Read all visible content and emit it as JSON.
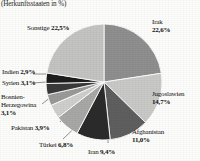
{
  "subtitle": "(Herkunftsstaaten in %)",
  "chart_data": {
    "type": "pie",
    "title": "",
    "subtitle": "(Herkunftsstaaten in %)",
    "xlabel": "",
    "ylabel": "",
    "units": "%",
    "decimal_separator": ",",
    "legend_position": "labels-around-pie",
    "grid": false,
    "start_angle_deg": 0,
    "direction": "clockwise",
    "categories": [
      "Irak",
      "Jugoslawien",
      "Afghanistan",
      "Iran",
      "Türkei",
      "Pakistan",
      "Bosnien-Herzegowina",
      "Syrien",
      "Indien",
      "Sonstige"
    ],
    "values": [
      22.6,
      14.7,
      11.0,
      9.4,
      6.8,
      3.9,
      3.1,
      3.1,
      2.9,
      22.5
    ],
    "value_labels": [
      "22,6%",
      "14,7%",
      "11,0%",
      "9,4%",
      "6,8%",
      "3,9%",
      "3,1%",
      "3,1%",
      "2,9%",
      "22,5%"
    ],
    "colors": [
      "#8f8f8f",
      "#c9c9c7",
      "#5f5f5f",
      "#2b2b2b",
      "#a8a8a6",
      "#cfcfcd",
      "#9a9a98",
      "#3a3a3a",
      "#1d1d1d",
      "#c4c4c2"
    ]
  },
  "slices": [
    {
      "name": "Irak",
      "label": "Irak",
      "value_label": "22,6%",
      "value": 22.6,
      "color": "#8f8f8f"
    },
    {
      "name": "Jugoslawien",
      "label": "Jugoslawien",
      "value_label": "14,7%",
      "value": 14.7,
      "color": "#c9c9c7"
    },
    {
      "name": "Afghanistan",
      "label": "Afghanistan",
      "value_label": "11,0%",
      "value": 11.0,
      "color": "#5f5f5f"
    },
    {
      "name": "Iran",
      "label": "Iran",
      "value_label": "9,4%",
      "value": 9.4,
      "color": "#2b2b2b"
    },
    {
      "name": "Tuerkei",
      "label": "Türkei",
      "value_label": "6,8%",
      "value": 6.8,
      "color": "#a8a8a6"
    },
    {
      "name": "Pakistan",
      "label": "Pakistan",
      "value_label": "3,9%",
      "value": 3.9,
      "color": "#cfcfcd"
    },
    {
      "name": "BosnienHerzegowina",
      "label": "Bosnien-Herzegowina",
      "label_line1": "Bosnien-",
      "label_line2": "Herzegowina",
      "value_label": "3,1%",
      "value": 3.1,
      "color": "#9a9a98"
    },
    {
      "name": "Syrien",
      "label": "Syrien",
      "value_label": "3,1%",
      "value": 3.1,
      "color": "#3a3a3a"
    },
    {
      "name": "Indien",
      "label": "Indien",
      "value_label": "2,9%",
      "value": 2.9,
      "color": "#1d1d1d"
    },
    {
      "name": "Sonstige",
      "label": "Sonstige",
      "value_label": "22,5%",
      "value": 22.5,
      "color": "#c4c4c2"
    }
  ]
}
